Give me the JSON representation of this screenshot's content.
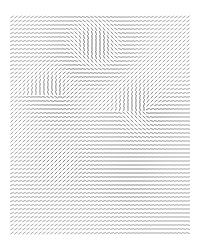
{
  "artwork": {
    "kind": "vector-field line-segment grid",
    "background": "#ffffff",
    "stroke_color": "#4a4a4a",
    "grid": {
      "x0": 12,
      "y0": 17,
      "dx": 4,
      "dy": 4,
      "cols": 45,
      "rows": 55,
      "segment_length": 3.2
    },
    "features": [
      {
        "x": 95,
        "y": 45,
        "strength": 1.0,
        "type": "vertical-streak"
      },
      {
        "x": 60,
        "y": 95,
        "strength": 0.8,
        "type": "swirl"
      },
      {
        "x": 145,
        "y": 110,
        "strength": 0.9,
        "type": "swirl"
      },
      {
        "x": 60,
        "y": 165,
        "strength": 0.9,
        "type": "diagonal"
      },
      {
        "x": 130,
        "y": 175,
        "strength": 0.7,
        "type": "horizontal"
      }
    ]
  }
}
